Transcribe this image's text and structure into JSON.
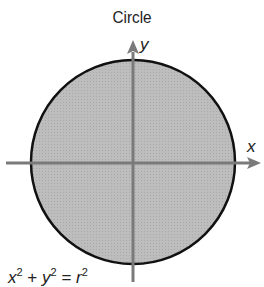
{
  "title": "Circle",
  "axes": {
    "x_label": "x",
    "y_label": "y"
  },
  "equation": {
    "base1": "x",
    "exp1": "2",
    "plus": "+",
    "base2": "y",
    "exp2": "2",
    "equals": "=",
    "base3": "r",
    "exp3": "2"
  },
  "colors": {
    "fill": "#b9b9b9",
    "outline": "#111111",
    "axis": "#7a7a7a"
  }
}
